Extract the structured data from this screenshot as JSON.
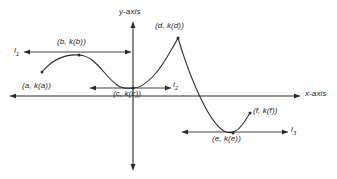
{
  "figure": {
    "type": "cartesian-graph-diagram",
    "background_color": "#ffffff",
    "stroke_color": "#2b2b2b",
    "text_color": "#1a1a1a"
  },
  "axes": {
    "x_label": "x-axis",
    "y_label": "y-axis",
    "origin_px": {
      "x": 133,
      "y": 96
    }
  },
  "points": [
    {
      "id": "a",
      "label": "(a, k(a))",
      "px": {
        "x": 42,
        "y": 72
      },
      "label_px": {
        "x": 22,
        "y": 82
      }
    },
    {
      "id": "b",
      "label": "(b, k(b))",
      "px": {
        "x": 79,
        "y": 55
      },
      "label_px": {
        "x": 57,
        "y": 38
      }
    },
    {
      "id": "c",
      "label": "(c, k(c))",
      "px": {
        "x": 133,
        "y": 88
      },
      "label_px": {
        "x": 113,
        "y": 90
      }
    },
    {
      "id": "d",
      "label": "(d, k(d))",
      "px": {
        "x": 178,
        "y": 38
      },
      "label_px": {
        "x": 155,
        "y": 22
      }
    },
    {
      "id": "e",
      "label": "(e, k(e))",
      "px": {
        "x": 233,
        "y": 133
      },
      "label_px": {
        "x": 212,
        "y": 135
      }
    },
    {
      "id": "f",
      "label": "(f, k(f))",
      "px": {
        "x": 250,
        "y": 113
      },
      "label_px": {
        "x": 253,
        "y": 112
      }
    }
  ],
  "tangent_lines": [
    {
      "id": "l1",
      "label": "l",
      "subscript": "1",
      "y_px": 52,
      "x_start_px": 24,
      "x_end_px": 131,
      "label_px": {
        "x": 14,
        "y": 47
      }
    },
    {
      "id": "l2",
      "label": "l",
      "subscript": "2",
      "y_px": 88,
      "x_start_px": 90,
      "x_end_px": 171,
      "label_px": {
        "x": 173,
        "y": 82
      }
    },
    {
      "id": "l3",
      "label": "l",
      "subscript": "3",
      "y_px": 132,
      "x_start_px": 182,
      "x_end_px": 288,
      "label_px": {
        "x": 291,
        "y": 127
      }
    }
  ],
  "curve": {
    "description": "Continuous curve rising from point a to local maximum b, descending to local minimum c, rising to a sharp cusp maximum at d, falling steeply through the x-axis to a local minimum at e, then rising to endpoint f",
    "path": "M 42,72 C 52,60 64,54 79,55 C 96,56 104,76 117,85 C 124,90 128,88 133,88 C 146,88 160,70 170,52 C 175,44 177,40 178,38 C 181,48 188,70 196,88 C 206,111 216,128 226,132 C 231,134 238,131 242,125 C 246,120 248,116 250,113"
  }
}
